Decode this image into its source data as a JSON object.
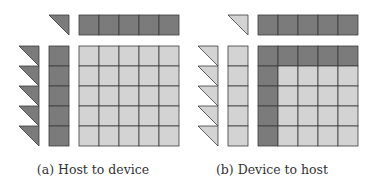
{
  "colors": {
    "dark": "#7b7b7b",
    "light": "#d3d3d3",
    "stroke": "#3c3c3c",
    "background": "#ffffff"
  },
  "grid": {
    "rows": 5,
    "cols": 5
  },
  "panels": [
    {
      "id": "a",
      "caption": "(a) Host to device",
      "corner_triangle": "dark",
      "top_strip": [
        "dark",
        "dark",
        "dark",
        "dark",
        "dark"
      ],
      "left_triangles": [
        "dark",
        "dark",
        "dark",
        "dark",
        "dark"
      ],
      "left_strip": [
        "dark",
        "dark",
        "dark",
        "dark",
        "dark"
      ],
      "matrix": [
        [
          "light",
          "light",
          "light",
          "light",
          "light"
        ],
        [
          "light",
          "light",
          "light",
          "light",
          "light"
        ],
        [
          "light",
          "light",
          "light",
          "light",
          "light"
        ],
        [
          "light",
          "light",
          "light",
          "light",
          "light"
        ],
        [
          "light",
          "light",
          "light",
          "light",
          "light"
        ]
      ]
    },
    {
      "id": "b",
      "caption": "(b) Device to host",
      "corner_triangle": "light",
      "top_strip": [
        "dark",
        "dark",
        "dark",
        "dark",
        "dark"
      ],
      "left_triangles": [
        "light",
        "light",
        "light",
        "light",
        "light"
      ],
      "left_strip": [
        "light",
        "light",
        "light",
        "light",
        "light"
      ],
      "matrix": [
        [
          "dark",
          "dark",
          "dark",
          "dark",
          "dark"
        ],
        [
          "dark",
          "light",
          "light",
          "light",
          "light"
        ],
        [
          "dark",
          "light",
          "light",
          "light",
          "light"
        ],
        [
          "dark",
          "light",
          "light",
          "light",
          "light"
        ],
        [
          "dark",
          "light",
          "light",
          "light",
          "light"
        ]
      ]
    }
  ]
}
